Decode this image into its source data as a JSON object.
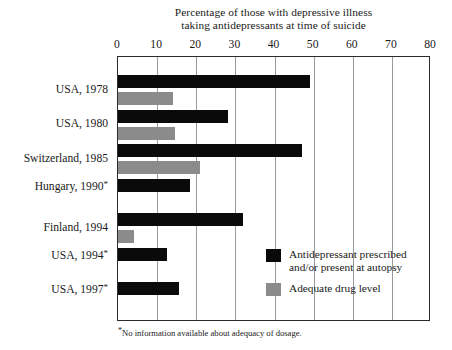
{
  "chart_data": {
    "type": "bar",
    "orientation": "horizontal",
    "title": "Percentage of those with depressive illness taking antidepressants at time of suicide",
    "title_lines": [
      "Percentage of those with depressive illness",
      "taking antidepressants at time of suicide"
    ],
    "xlabel": "",
    "ylabel": "",
    "xlim": [
      0,
      80
    ],
    "xticks": [
      0,
      10,
      20,
      30,
      40,
      50,
      60,
      70,
      80
    ],
    "xtick_labels": [
      "0",
      "10",
      "20",
      "30",
      "40",
      "50",
      "60",
      "70",
      "80"
    ],
    "grid": "vertical",
    "legend_position": "inside-lower-right",
    "categories": [
      "USA, 1978",
      "USA, 1980",
      "Switzerland, 1985",
      "Hungary, 1990*",
      "Finland, 1994",
      "USA, 1994*",
      "USA, 1997*"
    ],
    "category_footnote_marks": [
      false,
      false,
      false,
      true,
      false,
      true,
      true
    ],
    "series": [
      {
        "name": "Antidepressant prescribed and/or present at autopsy",
        "color": "#0a0a0a",
        "values": [
          49,
          28,
          47,
          18.5,
          32,
          12.5,
          15.5
        ]
      },
      {
        "name": "Adequate drug level",
        "color": "#8b8b8b",
        "values": [
          14,
          14.5,
          21,
          null,
          4,
          null,
          null
        ]
      }
    ],
    "footnote": "No information available about adequacy of dosage.",
    "footnote_marker": "*"
  },
  "legend": {
    "items": [
      {
        "swatch": "dark",
        "lines": [
          "Antidepressant prescribed",
          "and/or present at autopsy"
        ]
      },
      {
        "swatch": "gray",
        "lines": [
          "Adequate drug level"
        ]
      }
    ]
  },
  "colors": {
    "dark_series": "#0a0a0a",
    "gray_series": "#8b8b8b",
    "frame": "#2b2b2b",
    "gridline": "#9a9a9a",
    "background": "#ffffff",
    "text": "#1a1a1a"
  }
}
